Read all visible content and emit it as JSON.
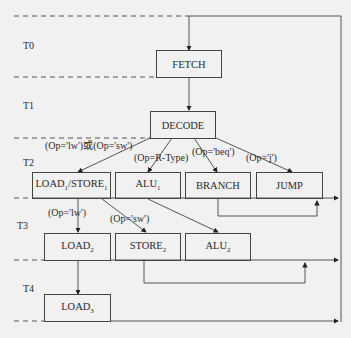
{
  "diagram": {
    "type": "state-machine-timing",
    "periods": [
      "T0",
      "T1",
      "T2",
      "T3",
      "T4"
    ],
    "states": {
      "fetch": "FETCH",
      "decode": "DECODE",
      "load1_store1": {
        "main": "LOAD",
        "sub1": "1",
        "sep": "/STORE",
        "sub2": "1"
      },
      "alu1": {
        "main": "ALU",
        "sub": "1"
      },
      "branch": "BRANCH",
      "jump": "JUMP",
      "load2": {
        "main": "LOAD",
        "sub": "2"
      },
      "store2": {
        "main": "STORE",
        "sub": "2"
      },
      "alu2": {
        "main": "ALU",
        "sub": "2"
      },
      "load3": {
        "main": "LOAD",
        "sub": "3"
      }
    },
    "conditions": {
      "lw_or_sw": "(Op='lw')或(Op='sw')",
      "rtype": "(Op=R-Type)",
      "beq": "(Op='beq')",
      "j": "(Op='j')",
      "lw": "(Op='lw')",
      "sw": "(Op='sw')"
    }
  }
}
